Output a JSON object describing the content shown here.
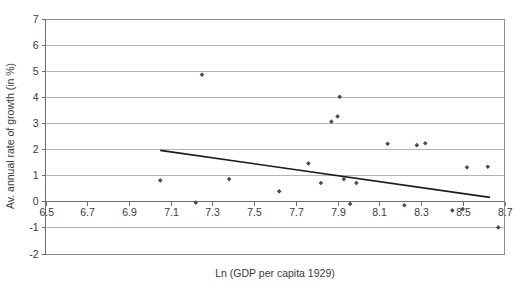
{
  "chart_data": {
    "type": "scatter",
    "title": "",
    "xlabel": "Ln (GDP per capita 1929)",
    "ylabel": "Av. annual rate of growth (in %)",
    "xlim": [
      6.5,
      8.7
    ],
    "ylim": [
      -2,
      7
    ],
    "xticks": [
      "6.5",
      "6.7",
      "6.9",
      "7.1",
      "7.3",
      "7.5",
      "7.7",
      "7.9",
      "8.1",
      "8.3",
      "8.5",
      "8.7"
    ],
    "xtick_values": [
      6.5,
      6.7,
      6.9,
      7.1,
      7.3,
      7.5,
      7.7,
      7.9,
      8.1,
      8.3,
      8.5,
      8.7
    ],
    "yticks": [
      "7",
      "6",
      "5",
      "4",
      "3",
      "2",
      "1",
      "0",
      "-1",
      "-2"
    ],
    "ytick_values": [
      7,
      6,
      5,
      4,
      3,
      2,
      1,
      0,
      -1,
      -2
    ],
    "grid": true,
    "legend": false,
    "legend_position": "none",
    "marker_color": "#4c4c4c",
    "gridline_color": "#b4b4b4",
    "trendline_color": "#1a1a1a",
    "background_color": "#ffffff",
    "points": [
      {
        "x": 7.05,
        "y": 0.8
      },
      {
        "x": 7.22,
        "y": -0.05
      },
      {
        "x": 7.25,
        "y": 4.85
      },
      {
        "x": 7.38,
        "y": 0.85
      },
      {
        "x": 7.62,
        "y": 0.38
      },
      {
        "x": 7.76,
        "y": 1.45
      },
      {
        "x": 7.82,
        "y": 0.7
      },
      {
        "x": 7.87,
        "y": 3.05
      },
      {
        "x": 7.9,
        "y": 3.25
      },
      {
        "x": 7.91,
        "y": 4.0
      },
      {
        "x": 7.93,
        "y": 0.85
      },
      {
        "x": 7.96,
        "y": -0.1
      },
      {
        "x": 7.99,
        "y": 0.7
      },
      {
        "x": 8.14,
        "y": 2.2
      },
      {
        "x": 8.22,
        "y": -0.15
      },
      {
        "x": 8.28,
        "y": 2.15
      },
      {
        "x": 8.32,
        "y": 2.22
      },
      {
        "x": 8.45,
        "y": -0.35
      },
      {
        "x": 8.5,
        "y": -0.3
      },
      {
        "x": 8.52,
        "y": 1.3
      },
      {
        "x": 8.62,
        "y": 1.32
      },
      {
        "x": 8.67,
        "y": -1.0
      }
    ],
    "trendline": {
      "x_start": 7.05,
      "y_start": 1.95,
      "x_end": 8.63,
      "y_end": 0.15
    }
  }
}
